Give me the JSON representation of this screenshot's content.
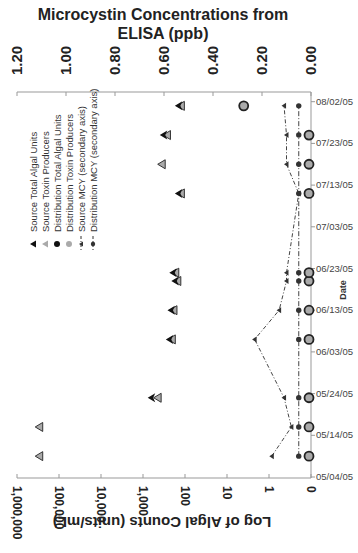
{
  "chart_data": {
    "type": "scatter",
    "orientation": "rotated-90",
    "title": "Microcystin Concentrations from ELISA (ppb)",
    "primary_axis": {
      "label": "Log of Algal Counts (units/mL)",
      "scale": "log",
      "ticks": [
        "1,000,000",
        "100,000",
        "10,000",
        "1,000",
        "100",
        "10",
        "1",
        "0"
      ],
      "range": [
        0,
        1000000
      ],
      "reversed": true
    },
    "secondary_axis": {
      "label": "Microcystin Concentrations from ELISA (ppb)",
      "ticks": [
        "1.20",
        "1.00",
        "0.80",
        "0.60",
        "0.40",
        "0.20",
        "0.00"
      ],
      "range": [
        0,
        1.2
      ],
      "reversed": true
    },
    "date_axis": {
      "label": "Date",
      "ticks": [
        "08/02/05",
        "07/23/05",
        "07/13/05",
        "07/03/05",
        "06/23/05",
        "06/13/05",
        "06/03/05",
        "05/24/05",
        "05/14/05",
        "05/04/05"
      ],
      "range": [
        "05/04/05",
        "08/02/05"
      ]
    },
    "legend": [
      {
        "name": "Source Total Algal Units",
        "marker": "triangle",
        "color": "#111111"
      },
      {
        "name": "Source Toxin Producers",
        "marker": "triangle",
        "color": "#aaaaaa"
      },
      {
        "name": "Distribution Total Algal Units",
        "marker": "circle",
        "color": "#111111"
      },
      {
        "name": "Distribution Toxin Producers",
        "marker": "circle",
        "color": "#aaaaaa"
      },
      {
        "name": "Source MCY (secondary axis)",
        "marker": "small-triangle-dashdot",
        "color": "#333333"
      },
      {
        "name": "Distribution MCY (secondary axis)",
        "marker": "small-circle-dashdot",
        "color": "#333333"
      }
    ],
    "dates": [
      "05/09/05",
      "05/16/05",
      "05/23/05",
      "06/06/05",
      "06/13/05",
      "06/20/05",
      "06/22/05",
      "07/11/05",
      "07/18/05",
      "07/25/05",
      "08/01/05"
    ],
    "series": [
      {
        "name": "Source Total Algal Units",
        "values": [
          null,
          null,
          620,
          230,
          210,
          170,
          190,
          140,
          null,
          320,
          140
        ]
      },
      {
        "name": "Source Toxin Producers",
        "values": [
          330000,
          330000,
          500,
          230,
          210,
          170,
          190,
          140,
          400,
          300,
          140
        ]
      },
      {
        "name": "Distribution Total Algal Units",
        "values": [
          0,
          0,
          0,
          0,
          0,
          0,
          0,
          0,
          0,
          0,
          4
        ]
      },
      {
        "name": "Distribution Toxin Producers",
        "values": [
          0,
          0,
          0,
          0,
          0,
          0,
          0,
          0,
          0,
          0,
          4
        ]
      },
      {
        "name": "Source MCY (secondary axis)",
        "values": [
          0.16,
          0.08,
          0.11,
          0.23,
          0.13,
          0.1,
          0.1,
          0.05,
          0.1,
          0.1,
          0.11
        ]
      },
      {
        "name": "Distribution MCY (secondary axis)",
        "values": [
          0.05,
          0.05,
          0.05,
          0.05,
          0.05,
          0.05,
          0.05,
          0.05,
          0.05,
          0.05,
          0.05
        ]
      }
    ],
    "grid": false,
    "legend_position": "inside-left"
  }
}
